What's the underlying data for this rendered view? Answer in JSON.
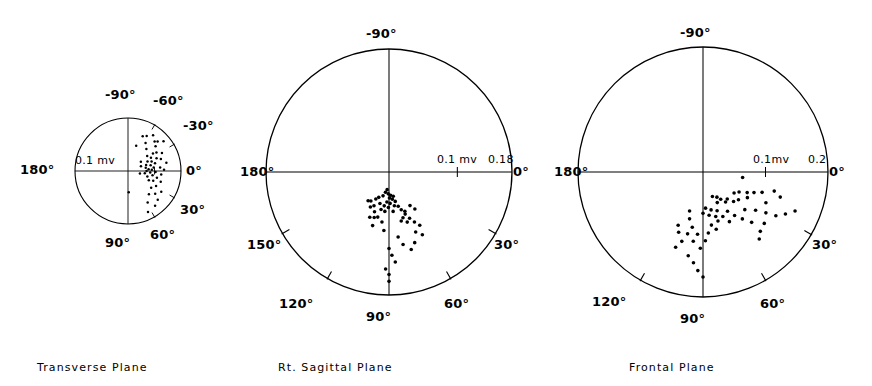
{
  "figure": {
    "background": "#ffffff",
    "ink_color": "#000000",
    "panel_count": 3
  },
  "chart_data": [
    {
      "type": "scatter",
      "title": "Transverse Plane",
      "coordinate_system": "polar",
      "xlabel": "",
      "ylabel": "",
      "grid": false,
      "legend": false,
      "radial_unit": "mv",
      "radial_max": 0.2,
      "scale_ticks": [
        {
          "label": "0.1 mv",
          "value": 0.1,
          "side": "right"
        }
      ],
      "angle_ticks": [
        {
          "label": "-90°",
          "value": -90
        },
        {
          "label": "-60°",
          "value": -60
        },
        {
          "label": "-30°",
          "value": -30
        },
        {
          "label": "0°",
          "value": 0
        },
        {
          "label": "30°",
          "value": 30
        },
        {
          "label": "60°",
          "value": 60
        },
        {
          "label": "90°",
          "value": 90
        },
        {
          "label": "180°",
          "value": 180
        }
      ],
      "tick_marks_deg": [
        -60,
        -30,
        30,
        60
      ],
      "points_polar": [
        {
          "angle": -67,
          "r": 0.142
        },
        {
          "angle": -62,
          "r": 0.15
        },
        {
          "angle": -58,
          "r": 0.125
        },
        {
          "angle": -55,
          "r": 0.165
        },
        {
          "angle": -72,
          "r": 0.1
        },
        {
          "angle": -50,
          "r": 0.108
        },
        {
          "angle": -48,
          "r": 0.15
        },
        {
          "angle": -45,
          "r": 0.158
        },
        {
          "angle": -42,
          "r": 0.14
        },
        {
          "angle": -40,
          "r": 0.175
        },
        {
          "angle": -38,
          "r": 0.092
        },
        {
          "angle": -35,
          "r": 0.115
        },
        {
          "angle": -33,
          "r": 0.128
        },
        {
          "angle": -30,
          "r": 0.1
        },
        {
          "angle": -28,
          "r": 0.145
        },
        {
          "angle": -26,
          "r": 0.082
        },
        {
          "angle": -24,
          "r": 0.118
        },
        {
          "angle": -22,
          "r": 0.096
        },
        {
          "angle": -20,
          "r": 0.132
        },
        {
          "angle": -18,
          "r": 0.072
        },
        {
          "angle": -16,
          "r": 0.106
        },
        {
          "angle": -14,
          "r": 0.088
        },
        {
          "angle": -12,
          "r": 0.148
        },
        {
          "angle": -10,
          "r": 0.068
        },
        {
          "angle": -8,
          "r": 0.098
        },
        {
          "angle": -6,
          "r": 0.122
        },
        {
          "angle": -5,
          "r": 0.078
        },
        {
          "angle": -3,
          "r": 0.09
        },
        {
          "angle": -2,
          "r": 0.136
        },
        {
          "angle": 0,
          "r": 0.07
        },
        {
          "angle": 2,
          "r": 0.104
        },
        {
          "angle": 4,
          "r": 0.084
        },
        {
          "angle": 6,
          "r": 0.126
        },
        {
          "angle": 8,
          "r": 0.064
        },
        {
          "angle": 10,
          "r": 0.094
        },
        {
          "angle": 13,
          "r": 0.112
        },
        {
          "angle": 16,
          "r": 0.076
        },
        {
          "angle": 18,
          "r": 0.13
        },
        {
          "angle": 21,
          "r": 0.102
        },
        {
          "angle": 24,
          "r": 0.086
        },
        {
          "angle": 28,
          "r": 0.12
        },
        {
          "angle": 32,
          "r": 0.148
        },
        {
          "angle": 36,
          "r": 0.108
        },
        {
          "angle": 40,
          "r": 0.134
        },
        {
          "angle": 44,
          "r": 0.156
        },
        {
          "angle": 48,
          "r": 0.118
        },
        {
          "angle": 52,
          "r": 0.166
        },
        {
          "angle": 58,
          "r": 0.14
        },
        {
          "angle": 64,
          "r": 0.172
        },
        {
          "angle": 88,
          "r": 0.08
        },
        {
          "angle": -36,
          "r": 0.06
        },
        {
          "angle": -20,
          "r": 0.052
        },
        {
          "angle": 12,
          "r": 0.046
        }
      ]
    },
    {
      "type": "scatter",
      "title": "Rt. Sagittal Plane",
      "coordinate_system": "polar",
      "xlabel": "",
      "ylabel": "",
      "grid": false,
      "legend": false,
      "radial_unit": "mv",
      "radial_max": 0.18,
      "scale_ticks": [
        {
          "label": "0.1 mv",
          "value": 0.1,
          "side": "right"
        },
        {
          "label": "0.18",
          "value": 0.18,
          "side": "right"
        }
      ],
      "angle_ticks": [
        {
          "label": "-90°",
          "value": -90
        },
        {
          "label": "0°",
          "value": 0
        },
        {
          "label": "30°",
          "value": 30
        },
        {
          "label": "60°",
          "value": 60
        },
        {
          "label": "90°",
          "value": 90
        },
        {
          "label": "120°",
          "value": 120
        },
        {
          "label": "150°",
          "value": 150
        },
        {
          "label": "180°",
          "value": 180
        }
      ],
      "tick_marks_deg": [
        30,
        60,
        120,
        150
      ],
      "points_polar": [
        {
          "angle": 96,
          "r": 0.058
        },
        {
          "angle": 73,
          "r": 0.07
        },
        {
          "angle": 70,
          "r": 0.078
        },
        {
          "angle": 76,
          "r": 0.074
        },
        {
          "angle": 68,
          "r": 0.062
        },
        {
          "angle": 81,
          "r": 0.05
        },
        {
          "angle": 84,
          "r": 0.058
        },
        {
          "angle": 88,
          "r": 0.046
        },
        {
          "angle": 91,
          "r": 0.052
        },
        {
          "angle": 94,
          "r": 0.044
        },
        {
          "angle": 98,
          "r": 0.05
        },
        {
          "angle": 102,
          "r": 0.056
        },
        {
          "angle": 106,
          "r": 0.048
        },
        {
          "angle": 110,
          "r": 0.062
        },
        {
          "angle": 114,
          "r": 0.054
        },
        {
          "angle": 108,
          "r": 0.07
        },
        {
          "angle": 112,
          "r": 0.04
        },
        {
          "angle": 104,
          "r": 0.036
        },
        {
          "angle": 100,
          "r": 0.03
        },
        {
          "angle": 96,
          "r": 0.026
        },
        {
          "angle": 92,
          "r": 0.032
        },
        {
          "angle": 89,
          "r": 0.038
        },
        {
          "angle": 86,
          "r": 0.034
        },
        {
          "angle": 83,
          "r": 0.04
        },
        {
          "angle": 80,
          "r": 0.036
        },
        {
          "angle": 78,
          "r": 0.044
        },
        {
          "angle": 75,
          "r": 0.052
        },
        {
          "angle": 72,
          "r": 0.058
        },
        {
          "angle": 69,
          "r": 0.066
        },
        {
          "angle": 66,
          "r": 0.074
        },
        {
          "angle": 63,
          "r": 0.082
        },
        {
          "angle": 60,
          "r": 0.09
        },
        {
          "angle": 66,
          "r": 0.096
        },
        {
          "angle": 62,
          "r": 0.104
        },
        {
          "angle": 58,
          "r": 0.058
        },
        {
          "angle": 55,
          "r": 0.066
        },
        {
          "angle": 70,
          "r": 0.11
        },
        {
          "angle": 74,
          "r": 0.118
        },
        {
          "angle": 90,
          "r": 0.112
        },
        {
          "angle": 88,
          "r": 0.122
        },
        {
          "angle": 86,
          "r": 0.132
        },
        {
          "angle": 92,
          "r": 0.142
        },
        {
          "angle": 90,
          "r": 0.15
        },
        {
          "angle": 90,
          "r": 0.16
        },
        {
          "angle": 79,
          "r": 0.108
        },
        {
          "angle": 82,
          "r": 0.096
        },
        {
          "angle": 118,
          "r": 0.058
        },
        {
          "angle": 122,
          "r": 0.05
        },
        {
          "angle": 116,
          "r": 0.044
        },
        {
          "angle": 126,
          "r": 0.052
        },
        {
          "angle": 104,
          "r": 0.068
        },
        {
          "angle": 107,
          "r": 0.082
        },
        {
          "angle": 113,
          "r": 0.072
        },
        {
          "angle": 98,
          "r": 0.074
        },
        {
          "angle": 95,
          "r": 0.086
        }
      ]
    },
    {
      "type": "scatter",
      "title": "Frontal Plane",
      "coordinate_system": "polar",
      "xlabel": "",
      "ylabel": "",
      "grid": false,
      "legend": false,
      "radial_unit": "mv",
      "radial_max": 0.2,
      "scale_ticks": [
        {
          "label": "0.1mv",
          "value": 0.1,
          "side": "right"
        },
        {
          "label": "0.2",
          "value": 0.2,
          "side": "right"
        }
      ],
      "angle_ticks": [
        {
          "label": "-90°",
          "value": -90
        },
        {
          "label": "0°",
          "value": 0
        },
        {
          "label": "30°",
          "value": 30
        },
        {
          "label": "60°",
          "value": 60
        },
        {
          "label": "90°",
          "value": 90
        },
        {
          "label": "120°",
          "value": 120
        },
        {
          "label": "180°",
          "value": 180
        }
      ],
      "tick_marks_deg": [
        30,
        60,
        120
      ],
      "points_polar": [
        {
          "angle": 8,
          "r": 0.064
        },
        {
          "angle": 30,
          "r": 0.082
        },
        {
          "angle": 36,
          "r": 0.104
        },
        {
          "angle": 42,
          "r": 0.09
        },
        {
          "angle": 33,
          "r": 0.12
        },
        {
          "angle": 40,
          "r": 0.128
        },
        {
          "angle": 46,
          "r": 0.112
        },
        {
          "angle": 50,
          "r": 0.098
        },
        {
          "angle": 54,
          "r": 0.086
        },
        {
          "angle": 58,
          "r": 0.074
        },
        {
          "angle": 62,
          "r": 0.09
        },
        {
          "angle": 66,
          "r": 0.078
        },
        {
          "angle": 70,
          "r": 0.066
        },
        {
          "angle": 74,
          "r": 0.074
        },
        {
          "angle": 78,
          "r": 0.062
        },
        {
          "angle": 82,
          "r": 0.07
        },
        {
          "angle": 86,
          "r": 0.058
        },
        {
          "angle": 90,
          "r": 0.066
        },
        {
          "angle": 53,
          "r": 0.06
        },
        {
          "angle": 57,
          "r": 0.052
        },
        {
          "angle": 61,
          "r": 0.046
        },
        {
          "angle": 65,
          "r": 0.054
        },
        {
          "angle": 69,
          "r": 0.042
        },
        {
          "angle": 44,
          "r": 0.068
        },
        {
          "angle": 48,
          "r": 0.058
        },
        {
          "angle": 38,
          "r": 0.072
        },
        {
          "angle": 34,
          "r": 0.06
        },
        {
          "angle": 29,
          "r": 0.066
        },
        {
          "angle": 25,
          "r": 0.078
        },
        {
          "angle": 22,
          "r": 0.088
        },
        {
          "angle": 19,
          "r": 0.1
        },
        {
          "angle": 26,
          "r": 0.112
        },
        {
          "angle": 31,
          "r": 0.136
        },
        {
          "angle": 27,
          "r": 0.148
        },
        {
          "angle": 23,
          "r": 0.16
        },
        {
          "angle": 73,
          "r": 0.082
        },
        {
          "angle": 77,
          "r": 0.094
        },
        {
          "angle": 81,
          "r": 0.086
        },
        {
          "angle": 85,
          "r": 0.098
        },
        {
          "angle": 88,
          "r": 0.11
        },
        {
          "angle": 92,
          "r": 0.122
        },
        {
          "angle": 95,
          "r": 0.1
        },
        {
          "angle": 98,
          "r": 0.112
        },
        {
          "angle": 101,
          "r": 0.09
        },
        {
          "angle": 104,
          "r": 0.102
        },
        {
          "angle": 107,
          "r": 0.116
        },
        {
          "angle": 110,
          "r": 0.128
        },
        {
          "angle": 100,
          "r": 0.136
        },
        {
          "angle": 96,
          "r": 0.146
        },
        {
          "angle": 93,
          "r": 0.158
        },
        {
          "angle": 90,
          "r": 0.168
        },
        {
          "angle": 112,
          "r": 0.104
        },
        {
          "angle": 115,
          "r": 0.094
        },
        {
          "angle": 106,
          "r": 0.078
        },
        {
          "angle": 109,
          "r": 0.066
        },
        {
          "angle": 50,
          "r": 0.14
        },
        {
          "angle": 46,
          "r": 0.132
        },
        {
          "angle": 18,
          "r": 0.13
        },
        {
          "angle": 15,
          "r": 0.118
        }
      ]
    }
  ],
  "panels": [
    {
      "name": "transverse",
      "caption": "Transverse Plane",
      "geometry": {
        "cx": 128,
        "cy": 171,
        "r": 53
      },
      "scale_labels": [
        {
          "text": "0.1 mv",
          "x": 75,
          "y": 155,
          "size": 11
        }
      ],
      "angle_labels": [
        {
          "text": "-90°",
          "x": 105,
          "y": 88,
          "size": 13
        },
        {
          "text": "-60°",
          "x": 153,
          "y": 94,
          "size": 13
        },
        {
          "text": "-30°",
          "x": 183,
          "y": 119,
          "size": 13
        },
        {
          "text": "0°",
          "x": 186,
          "y": 164,
          "size": 13
        },
        {
          "text": "30°",
          "x": 180,
          "y": 203,
          "size": 13
        },
        {
          "text": "60°",
          "x": 150,
          "y": 228,
          "size": 13
        },
        {
          "text": "90°",
          "x": 105,
          "y": 236,
          "size": 13
        },
        {
          "text": "180°",
          "x": 20,
          "y": 163,
          "size": 13
        }
      ],
      "caption_pos": {
        "x": 37,
        "y": 362,
        "size": 11
      }
    },
    {
      "name": "rt-sagittal",
      "caption": "Rt. Sagittal Plane",
      "geometry": {
        "cx": 389,
        "cy": 172,
        "r": 123
      },
      "scale_labels": [
        {
          "text": "0.1 mv",
          "x": 437,
          "y": 154,
          "size": 11
        },
        {
          "text": "0.18",
          "x": 488,
          "y": 154,
          "size": 11
        }
      ],
      "angle_labels": [
        {
          "text": "-90°",
          "x": 366,
          "y": 27,
          "size": 13
        },
        {
          "text": "0°",
          "x": 513,
          "y": 165,
          "size": 13
        },
        {
          "text": "30°",
          "x": 494,
          "y": 238,
          "size": 13
        },
        {
          "text": "60°",
          "x": 444,
          "y": 297,
          "size": 13
        },
        {
          "text": "90°",
          "x": 366,
          "y": 310,
          "size": 13
        },
        {
          "text": "120°",
          "x": 279,
          "y": 297,
          "size": 13
        },
        {
          "text": "150°",
          "x": 247,
          "y": 238,
          "size": 13
        },
        {
          "text": "180°",
          "x": 240,
          "y": 165,
          "size": 13
        }
      ],
      "caption_pos": {
        "x": 278,
        "y": 362,
        "size": 11
      }
    },
    {
      "name": "frontal",
      "caption": "Frontal Plane",
      "geometry": {
        "cx": 703,
        "cy": 172,
        "r": 125
      },
      "scale_labels": [
        {
          "text": "0.1mv",
          "x": 753,
          "y": 154,
          "size": 11
        },
        {
          "text": "0.2",
          "x": 808,
          "y": 154,
          "size": 11
        }
      ],
      "angle_labels": [
        {
          "text": "-90°",
          "x": 680,
          "y": 26,
          "size": 13
        },
        {
          "text": "0°",
          "x": 829,
          "y": 165,
          "size": 13
        },
        {
          "text": "30°",
          "x": 812,
          "y": 238,
          "size": 13
        },
        {
          "text": "60°",
          "x": 760,
          "y": 297,
          "size": 13
        },
        {
          "text": "90°",
          "x": 680,
          "y": 312,
          "size": 13
        },
        {
          "text": "120°",
          "x": 592,
          "y": 295,
          "size": 13
        },
        {
          "text": "180°",
          "x": 554,
          "y": 165,
          "size": 13
        }
      ],
      "caption_pos": {
        "x": 629,
        "y": 362,
        "size": 11
      }
    }
  ]
}
